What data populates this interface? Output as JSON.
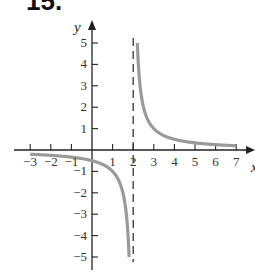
{
  "problem_number": "15.",
  "chart_data": {
    "type": "line",
    "title": "",
    "function": "y = 1/(x - 2)",
    "xlabel": "x",
    "ylabel": "y",
    "xlim": [
      -3,
      7
    ],
    "ylim": [
      -5,
      5
    ],
    "x_ticks": [
      -3,
      -2,
      -1,
      1,
      2,
      3,
      4,
      5,
      6,
      7
    ],
    "y_ticks": [
      -5,
      -4,
      -3,
      -2,
      -1,
      1,
      2,
      3,
      4,
      5
    ],
    "x_tick_labels": [
      "−3",
      "−2",
      "−1",
      "1",
      "2",
      "3",
      "4",
      "5",
      "6",
      "7"
    ],
    "y_tick_labels": [
      "−5",
      "−4",
      "−3",
      "−2",
      "−1",
      "1",
      "2",
      "3",
      "4",
      "5"
    ],
    "asymptotes": [
      {
        "type": "vertical",
        "x": 2,
        "style": "dashed"
      },
      {
        "type": "horizontal",
        "y": 0
      }
    ],
    "series": [
      {
        "name": "left branch",
        "x": [
          -3,
          -2,
          -1,
          0,
          1,
          1.5,
          1.8,
          1.8
        ],
        "values": [
          -0.2,
          -0.25,
          -0.333,
          -0.5,
          -1,
          -2,
          -5,
          -5
        ]
      },
      {
        "name": "right branch",
        "x": [
          2.2,
          2.5,
          3,
          4,
          5,
          6,
          7
        ],
        "values": [
          5,
          2,
          1,
          0.5,
          0.333,
          0.25,
          0.2
        ]
      }
    ],
    "curve_color": "#9a9a9a",
    "grid": false
  }
}
